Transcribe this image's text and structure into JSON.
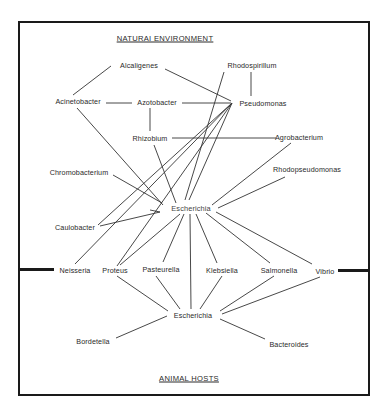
{
  "diagram": {
    "top_heading": "NATURAI   ENVIRONMENT",
    "bottom_heading": "ANIMAL HOSTS",
    "nodes": {
      "alcaligenes": "Alcaligenes",
      "rhodospirillum": "Rhodospirillum",
      "acinetobacter": "Acinetobacter",
      "azotobacter": "Azotobacter",
      "pseudomonas": "Pseudomonas",
      "rhizobium": "Rhizobium",
      "agrobacterium": "Agrobacterium",
      "chromobacterium": "Chromobacterium",
      "rhodopseudomonas": "Rhodopseudomonas",
      "escherichia_env": "Escherichia",
      "caulobacter": "Caulobacter",
      "neisseria": "Neisseria",
      "proteus": "Proteus",
      "pasteurella": "Pasteurella",
      "klebsiella": "Klebsiella",
      "salmonella": "Salmonella",
      "vibrio": "Vibrio",
      "escherichia_host": "Escherichia",
      "bordetella": "Bordetella",
      "bacteroides": "Bacteroides"
    },
    "edges": [
      [
        "acinetobacter",
        "alcaligenes"
      ],
      [
        "alcaligenes",
        "pseudomonas"
      ],
      [
        "rhodospirillum",
        "pseudomonas"
      ],
      [
        "acinetobacter",
        "azotobacter"
      ],
      [
        "azotobacter",
        "pseudomonas"
      ],
      [
        "azotobacter",
        "rhizobium"
      ],
      [
        "rhizobium",
        "agrobacterium"
      ],
      [
        "rhodospirillum",
        "escherichia_env"
      ],
      [
        "pseudomonas",
        "escherichia_env"
      ],
      [
        "pseudomonas",
        "proteus"
      ],
      [
        "pseudomonas",
        "caulobacter"
      ],
      [
        "acinetobacter",
        "escherichia_env"
      ],
      [
        "rhizobium",
        "escherichia_env"
      ],
      [
        "chromobacterium",
        "escherichia_env"
      ],
      [
        "agrobacterium",
        "escherichia_env"
      ],
      [
        "rhodopseudomonas",
        "escherichia_env"
      ],
      [
        "caulobacter",
        "escherichia_env"
      ],
      [
        "neisseria",
        "pseudomonas"
      ],
      [
        "escherichia_env",
        "proteus"
      ],
      [
        "escherichia_env",
        "pasteurella"
      ],
      [
        "escherichia_env",
        "escherichia_host"
      ],
      [
        "escherichia_env",
        "klebsiella"
      ],
      [
        "escherichia_env",
        "salmonella"
      ],
      [
        "escherichia_env",
        "vibrio"
      ],
      [
        "proteus",
        "escherichia_host"
      ],
      [
        "pasteurella",
        "escherichia_host"
      ],
      [
        "klebsiella",
        "escherichia_host"
      ],
      [
        "salmonella",
        "escherichia_host"
      ],
      [
        "vibrio",
        "escherichia_host"
      ],
      [
        "escherichia_host",
        "bordetella"
      ],
      [
        "escherichia_host",
        "bacteroides"
      ]
    ]
  }
}
